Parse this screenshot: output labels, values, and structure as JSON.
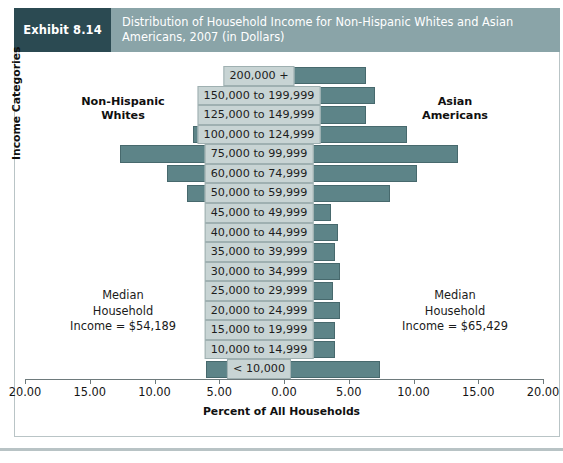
{
  "exhibit": {
    "tag": "Exhibit 8.14",
    "title_line1": "Distribution of Household Income for Non-Hispanic Whites and Asian",
    "title_line2": "Americans, 2007 (in Dollars)"
  },
  "annotations": {
    "left_group_line1": "Non-Hispanic",
    "left_group_line2": "Whites",
    "right_group_line1": "Asian",
    "right_group_line2": "Americans",
    "left_median_line1": "Median",
    "left_median_line2": "Household",
    "left_median_line3": "Income = $54,189",
    "right_median_line1": "Median",
    "right_median_line2": "Household",
    "right_median_line3": "Income = $65,429"
  },
  "colors": {
    "bar_fill": "#5d8488",
    "bar_stroke": "#47696d",
    "label_fill": "#c8d4d4",
    "header_band": "#8aa4a8",
    "header_tag": "#2b4a52"
  },
  "chart_data": {
    "type": "bar",
    "orientation": "horizontal-pyramid",
    "title": "Distribution of Household Income for Non-Hispanic Whites and Asian Americans, 2007 (in Dollars)",
    "xlabel": "Percent of All Households",
    "ylabel": "Income Categories",
    "xlim": [
      -20,
      20
    ],
    "xtick_values": [
      -20,
      -15,
      -10,
      -5,
      0,
      5,
      10,
      15,
      20
    ],
    "xtick_labels": [
      "20.00",
      "15.00",
      "10.00",
      "5.00",
      "0.00",
      "5.00",
      "10.00",
      "15.00",
      "20.00"
    ],
    "grid": false,
    "legend": "side-labels",
    "categories": [
      "200,000 +",
      "150,000 to 199,999",
      "125,000 to 149,999",
      "100,000 to 124,999",
      "75,000 to 99,999",
      "60,000 to 74,999",
      "50,000 to 59,999",
      "45,000 to 49,999",
      "40,000 to 44,999",
      "35,000 to 39,999",
      "30,000 to 34,999",
      "25,000 to 29,999",
      "20,000 to 24,999",
      "15,000 to 19,999",
      "10,000 to 14,999",
      "< 10,000"
    ],
    "series": [
      {
        "name": "Non-Hispanic Whites",
        "side": "left",
        "values": [
          1.1,
          4.6,
          4.6,
          7.0,
          12.7,
          9.0,
          7.5,
          4.9,
          4.9,
          4.8,
          4.8,
          4.7,
          4.8,
          4.9,
          4.9,
          6.0
        ]
      },
      {
        "name": "Asian Americans",
        "side": "right",
        "values": [
          6.3,
          7.0,
          6.3,
          9.5,
          13.4,
          10.3,
          8.2,
          3.6,
          4.2,
          3.9,
          4.3,
          3.8,
          4.3,
          3.9,
          3.9,
          7.4
        ]
      }
    ]
  }
}
